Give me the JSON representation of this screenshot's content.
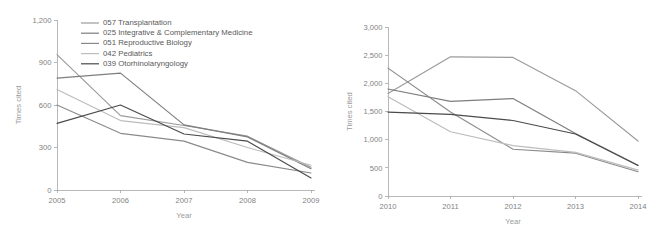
{
  "figure": {
    "background": "#ffffff",
    "panel_count": 2
  },
  "chart_data": [
    {
      "id": "left",
      "type": "line",
      "title": "",
      "xlabel": "Year",
      "ylabel": "Times cited",
      "x": [
        2005,
        2006,
        2007,
        2008,
        2009
      ],
      "xtick_labels": [
        "2005",
        "2006",
        "2007",
        "2008",
        "2009"
      ],
      "ytick_labels": [
        "0",
        "300",
        "600",
        "900",
        "1,200"
      ],
      "yticks": [
        0,
        300,
        600,
        900,
        1200
      ],
      "ylim": [
        0,
        1200
      ],
      "xlim": [
        2005,
        2009
      ],
      "grid": false,
      "legend_position": "upper-left-inside",
      "series": [
        {
          "name": "057 Transplantation",
          "code": "057",
          "color": "#9b9b9b",
          "values": [
            955,
            525,
            455,
            380,
            160
          ]
        },
        {
          "name": "025 Integrative & Complementary Medicine",
          "code": "025",
          "color": "#7d7d7d",
          "values": [
            790,
            825,
            460,
            375,
            150
          ]
        },
        {
          "name": "051 Reproductive Biology",
          "code": "051",
          "color": "#8a8a8a",
          "values": [
            600,
            400,
            345,
            195,
            120
          ]
        },
        {
          "name": "042 Pediatrics",
          "code": "042",
          "color": "#bcbcbc",
          "values": [
            710,
            490,
            440,
            300,
            175
          ]
        },
        {
          "name": "039 Otorhinolaryngology",
          "code": "039",
          "color": "#4a4a4a",
          "values": [
            470,
            600,
            395,
            345,
            85
          ]
        }
      ]
    },
    {
      "id": "right",
      "type": "line",
      "title": "",
      "xlabel": "Year",
      "ylabel": "Times cited",
      "x": [
        2010,
        2011,
        2012,
        2013,
        2014
      ],
      "xtick_labels": [
        "2010",
        "2011",
        "2012",
        "2013",
        "2014"
      ],
      "ytick_labels": [
        "0",
        "500",
        "1,000",
        "1,500",
        "2,000",
        "2,500",
        "3,000"
      ],
      "yticks": [
        0,
        500,
        1000,
        1500,
        2000,
        2500,
        3000
      ],
      "ylim": [
        0,
        3000
      ],
      "xlim": [
        2010,
        2014
      ],
      "grid": false,
      "legend_position": "none",
      "series": [
        {
          "name": "057 Transplantation",
          "code": "057",
          "color": "#9b9b9b",
          "values": [
            1820,
            2470,
            2460,
            1870,
            975
          ]
        },
        {
          "name": "025 Integrative & Complementary Medicine",
          "code": "025",
          "color": "#7d7d7d",
          "values": [
            1900,
            1680,
            1730,
            1110,
            545
          ]
        },
        {
          "name": "051 Reproductive Biology",
          "code": "051",
          "color": "#8a8a8a",
          "values": [
            2270,
            1490,
            830,
            760,
            430
          ]
        },
        {
          "name": "042 Pediatrics",
          "code": "042",
          "color": "#bcbcbc",
          "values": [
            1760,
            1140,
            895,
            775,
            460
          ]
        },
        {
          "name": "039 Otorhinolaryngology",
          "code": "039",
          "color": "#4a4a4a",
          "values": [
            1490,
            1450,
            1340,
            1100,
            540
          ]
        }
      ]
    }
  ]
}
